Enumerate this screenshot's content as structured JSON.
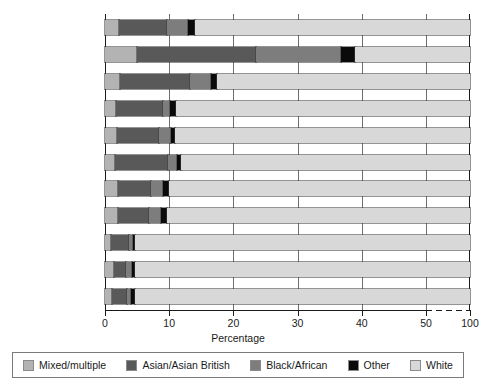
{
  "chart_data": {
    "type": "bar",
    "orientation": "horizontal",
    "stacked": true,
    "normalized_percent": true,
    "title": "",
    "xlabel": "Percentage",
    "ylabel": "",
    "xlim": [
      0,
      100
    ],
    "xticks": [
      0,
      10,
      20,
      30,
      40,
      50,
      100
    ],
    "xtick_labels": [
      "0",
      "10",
      "20",
      "30",
      "40",
      "50",
      "100"
    ],
    "axis_break": {
      "after": 50,
      "to": 100,
      "style": "dashed"
    },
    "grid": true,
    "grid_axis": "x",
    "legend_position": "bottom",
    "categories": [
      "England and Wales",
      "London",
      "West Midlands",
      "Yorkshire and\nThe Humber",
      "East Midlands",
      "North West",
      "South East",
      "East of England",
      "North East",
      "South West",
      "Wales"
    ],
    "category_labels": [
      [
        "England and Wales"
      ],
      [
        "London"
      ],
      [
        "West Midlands"
      ],
      [
        "Yorkshire and",
        "The Humber"
      ],
      [
        "East Midlands"
      ],
      [
        "North West"
      ],
      [
        "South East"
      ],
      [
        "East of England"
      ],
      [
        "North East"
      ],
      [
        "South West"
      ],
      [
        "Wales"
      ]
    ],
    "series": [
      {
        "name": "Mixed/multiple",
        "color": "#b3b3b3",
        "values": [
          2.2,
          5.0,
          2.4,
          1.7,
          1.9,
          1.6,
          2.0,
          2.0,
          0.9,
          1.4,
          1.1
        ]
      },
      {
        "name": "Asian/Asian British",
        "color": "#595959",
        "values": [
          7.5,
          18.5,
          10.8,
          7.3,
          6.5,
          8.2,
          5.2,
          4.8,
          2.9,
          1.9,
          2.3
        ]
      },
      {
        "name": "Black/African",
        "color": "#7d7d7d",
        "values": [
          3.3,
          13.3,
          3.3,
          1.2,
          1.9,
          1.4,
          1.9,
          2.0,
          0.5,
          0.9,
          0.6
        ]
      },
      {
        "name": "Other",
        "color": "#0a0a0a",
        "values": [
          1.0,
          2.1,
          1.0,
          0.8,
          0.6,
          0.6,
          0.9,
          0.9,
          0.4,
          0.5,
          0.6
        ]
      },
      {
        "name": "White",
        "color": "#d8d8d8",
        "values": [
          86.0,
          61.1,
          82.5,
          89.0,
          89.1,
          88.2,
          90.0,
          90.3,
          95.3,
          95.3,
          95.4
        ]
      }
    ]
  },
  "legend": {
    "items": [
      {
        "label": "Mixed/multiple",
        "color": "#b3b3b3"
      },
      {
        "label": "Asian/Asian British",
        "color": "#595959"
      },
      {
        "label": "Black/African",
        "color": "#7d7d7d"
      },
      {
        "label": "Other",
        "color": "#0a0a0a"
      },
      {
        "label": "White",
        "color": "#d8d8d8"
      }
    ]
  }
}
